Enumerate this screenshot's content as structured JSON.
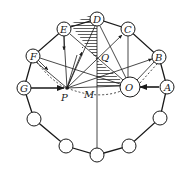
{
  "diagram": {
    "type": "geometry-optics-diagram",
    "colors": {
      "stroke": "#1a1a1a",
      "background": "#ffffff",
      "hatch": "#1a1a1a"
    },
    "outer_ring": {
      "description": "ring of 13 small circles connected by a polygonal outline",
      "node_radius": 7
    },
    "labeled_nodes": [
      {
        "id": "A",
        "label": "A",
        "x": 167,
        "y": 87
      },
      {
        "id": "B",
        "label": "B",
        "x": 159,
        "y": 57
      },
      {
        "id": "C",
        "label": "C",
        "x": 128,
        "y": 29
      },
      {
        "id": "D",
        "label": "D",
        "x": 97,
        "y": 19
      },
      {
        "id": "E",
        "label": "E",
        "x": 64,
        "y": 29
      },
      {
        "id": "F",
        "label": "F",
        "x": 33,
        "y": 56
      },
      {
        "id": "G",
        "label": "G",
        "x": 24,
        "y": 88
      }
    ],
    "unlabeled_nodes": [
      {
        "x": 34,
        "y": 119
      },
      {
        "x": 66,
        "y": 146
      },
      {
        "x": 97,
        "y": 155
      },
      {
        "x": 129,
        "y": 146
      },
      {
        "x": 160,
        "y": 118
      }
    ],
    "center_node": {
      "id": "O",
      "label": "O",
      "x": 130,
      "y": 87,
      "r": 10
    },
    "points": {
      "P": {
        "label": "P",
        "x": 67,
        "y": 88,
        "label_x": 60,
        "label_y": 101
      },
      "M": {
        "label": "M",
        "x": 97,
        "y": 92,
        "label_x": 85,
        "label_y": 98
      },
      "Q": {
        "label": "Q",
        "x": 105,
        "y": 57,
        "label_x": 101,
        "label_y": 61
      }
    },
    "labels": {
      "A": "A",
      "B": "B",
      "C": "C",
      "D": "D",
      "E": "E",
      "F": "F",
      "G": "G",
      "O": "O",
      "P": "P",
      "M": "M",
      "Q": "Q"
    }
  }
}
